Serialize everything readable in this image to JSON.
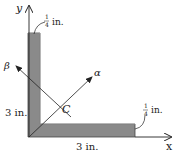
{
  "figure": {
    "axes": {
      "x_label": "x",
      "y_label": "y",
      "alpha_label": "α",
      "beta_label": "β"
    },
    "centroid_label": "C",
    "dimensions": {
      "vertical_leg_length": "3 in.",
      "horizontal_leg_length": "3 in.",
      "vertical_leg_thickness_num": "1",
      "vertical_leg_thickness_den": "4",
      "vertical_leg_thickness_unit": "in.",
      "horizontal_leg_thickness_num": "1",
      "horizontal_leg_thickness_den": "4",
      "horizontal_leg_thickness_unit": "in."
    },
    "colors": {
      "section_fill": "#8a8a8a",
      "section_edge": "#444444",
      "line": "#222222"
    }
  }
}
